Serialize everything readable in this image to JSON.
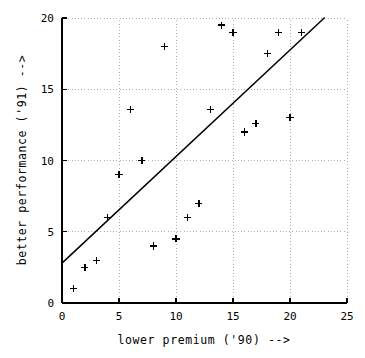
{
  "chart_data": {
    "type": "scatter",
    "title": "",
    "subtitle": "",
    "xlabel": "lower premium ('90)  -->",
    "ylabel": "better performance ('91)  -->",
    "xlim": [
      0,
      25
    ],
    "ylim": [
      0,
      20
    ],
    "xticks": [
      0,
      5,
      10,
      15,
      20,
      25
    ],
    "yticks": [
      0,
      5,
      10,
      15,
      20
    ],
    "xtick_labels": [
      "0",
      "5",
      "10",
      "15",
      "20",
      "25"
    ],
    "ytick_labels": [
      "0",
      "5",
      "10",
      "15",
      "20"
    ],
    "grid": true,
    "grid_style": "dotted",
    "legend": null,
    "marker_symbol": "plus",
    "marker_color": "#000000",
    "line_color": "#000000",
    "background_color": "#ffffff",
    "points": [
      {
        "x": 1,
        "y": 1.0
      },
      {
        "x": 2,
        "y": 2.5
      },
      {
        "x": 3,
        "y": 3.0
      },
      {
        "x": 4,
        "y": 6.0
      },
      {
        "x": 5,
        "y": 9.0
      },
      {
        "x": 6,
        "y": 13.6
      },
      {
        "x": 7,
        "y": 10.0
      },
      {
        "x": 8,
        "y": 4.0
      },
      {
        "x": 9,
        "y": 18.0
      },
      {
        "x": 10,
        "y": 4.5
      },
      {
        "x": 11,
        "y": 6.0
      },
      {
        "x": 12,
        "y": 7.0
      },
      {
        "x": 13,
        "y": 13.6
      },
      {
        "x": 14,
        "y": 19.5
      },
      {
        "x": 15,
        "y": 19.0
      },
      {
        "x": 16,
        "y": 12.0
      },
      {
        "x": 17,
        "y": 12.6
      },
      {
        "x": 18,
        "y": 17.5
      },
      {
        "x": 19,
        "y": 19.0
      },
      {
        "x": 20,
        "y": 13.0
      },
      {
        "x": 21,
        "y": 19.0
      }
    ],
    "trend_line": {
      "name": "fit-line",
      "x_start": 0,
      "y_start": 2.8,
      "x_end": 23,
      "y_end": 20.0,
      "slope": 0.748,
      "intercept": 2.8
    }
  }
}
